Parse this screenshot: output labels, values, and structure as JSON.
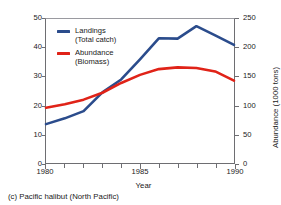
{
  "caption": "(c)  Pacific halibut (North Pacific)",
  "legend": {
    "entries": [
      {
        "name": "Landings",
        "line1": "Landings",
        "line2": "(Total catch)",
        "color": "#2b4c8c"
      },
      {
        "name": "Abundance",
        "line1": "Abundance",
        "line2": "(Biomass)",
        "color": "#e02318"
      }
    ]
  },
  "chart_data": {
    "type": "line",
    "title": "",
    "subtitle": "",
    "caption": "(c)  Pacific halibut (North Pacific)",
    "xlabel": "Year",
    "ylabel": "Landings (1000 tons)",
    "y2label": "Abundance (1000 tons)",
    "xlim": [
      1980,
      1990
    ],
    "ylim": [
      0,
      50
    ],
    "y2lim": [
      0,
      250
    ],
    "xticks": [
      1980,
      1985,
      1990
    ],
    "xticklabels": [
      "1980",
      "1985",
      "1990"
    ],
    "x_minor_ticks": [
      1980,
      1981,
      1982,
      1983,
      1984,
      1985,
      1986,
      1987,
      1988,
      1989,
      1990
    ],
    "yticks": [
      0,
      10,
      20,
      30,
      40,
      50
    ],
    "yticklabels": [
      "0",
      "10",
      "20",
      "30",
      "40",
      "50"
    ],
    "y2ticks": [
      0,
      50,
      100,
      150,
      200,
      250
    ],
    "y2ticklabels": [
      "0",
      "50",
      "100",
      "150",
      "200",
      "250"
    ],
    "grid": false,
    "legend_position": "upper left",
    "x": [
      1980,
      1981,
      1982,
      1983,
      1984,
      1985,
      1986,
      1987,
      1988,
      1989,
      1990
    ],
    "series": [
      {
        "name": "Landings (Total catch)",
        "axis": "left",
        "units": "1000 tons",
        "color": "#2b4c8c",
        "values": [
          13.5,
          15.5,
          18.0,
          24.5,
          29.0,
          36.0,
          43.3,
          43.2,
          47.5,
          44.3,
          41.0
        ]
      },
      {
        "name": "Abundance (Biomass)",
        "axis": "right",
        "units": "1000 tons",
        "color": "#e02318",
        "values": [
          96,
          102,
          110,
          122,
          139,
          153,
          163,
          166,
          165,
          159,
          143
        ]
      }
    ]
  }
}
